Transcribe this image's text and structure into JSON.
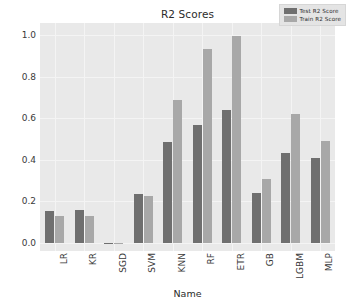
{
  "chart_data": {
    "type": "bar",
    "title": "R2 Scores",
    "xlabel": "Name",
    "ylabel": "",
    "categories": [
      "LR",
      "KR",
      "SGD",
      "SVM",
      "KNN",
      "RF",
      "ETR",
      "GB",
      "LGBM",
      "MLP"
    ],
    "series": [
      {
        "name": "Test R2 Score",
        "color": "#6f6f6f",
        "values": [
          0.155,
          0.157,
          -0.005,
          0.235,
          0.487,
          0.568,
          0.638,
          0.241,
          0.432,
          0.408
        ]
      },
      {
        "name": "Train R2 Score",
        "color": "#a8a8a8",
        "values": [
          0.128,
          0.128,
          -0.004,
          0.226,
          0.687,
          0.935,
          0.997,
          0.308,
          0.621,
          0.491
        ]
      }
    ],
    "yticks": [
      "0.0",
      "0.2",
      "0.4",
      "0.6",
      "0.8",
      "1.0"
    ],
    "ytick_values": [
      0.0,
      0.2,
      0.4,
      0.6,
      0.8,
      1.0
    ],
    "ylim": [
      -0.04,
      1.06
    ],
    "grid": true,
    "legend_position": "upper right",
    "plot_background": "#e9e9e9",
    "figure_background": "#ffffff",
    "grid_color": "#f4f4f4"
  },
  "legend": {
    "entries": [
      {
        "label": "Test R2 Score"
      },
      {
        "label": "Train R2 Score"
      }
    ]
  }
}
